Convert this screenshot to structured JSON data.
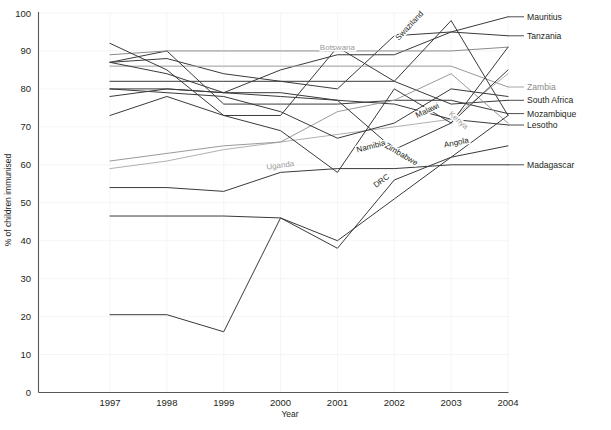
{
  "chart_data": {
    "type": "line",
    "title": "",
    "xlabel": "Year",
    "ylabel": "% of children immunised",
    "x": [
      1997,
      1998,
      1999,
      2000,
      2001,
      2002,
      2003,
      2004
    ],
    "xticklabels": [
      "1997",
      "1998",
      "1999",
      "2000",
      "2001",
      "2002",
      "2003",
      "2004"
    ],
    "yticks": [
      0,
      10,
      20,
      30,
      40,
      50,
      60,
      70,
      80,
      90,
      100
    ],
    "yticklabels": [
      "0",
      "10",
      "20",
      "30",
      "40",
      "50",
      "60",
      "70",
      "80",
      "90",
      "100"
    ],
    "ylim": [
      0,
      100
    ],
    "xlim": [
      1997,
      2004
    ],
    "grid": true,
    "legend": "inline-end-labels",
    "series": [
      {
        "name": "Mauritius",
        "color": "#3a3a3a",
        "label_side": "right",
        "label_y": 99,
        "values": [
          87,
          88,
          84,
          82,
          80,
          94,
          95,
          99
        ]
      },
      {
        "name": "Tanzania",
        "color": "#3a3a3a",
        "label_side": "right",
        "label_y": 94,
        "values": [
          78,
          80,
          79,
          85,
          89,
          89,
          95,
          94
        ]
      },
      {
        "name": "Zambia",
        "color": "#9a9a9a",
        "label_side": "right",
        "label_y": 80.5,
        "values": [
          86,
          86,
          86,
          86,
          86,
          86,
          86,
          80.5
        ]
      },
      {
        "name": "South Africa",
        "color": "#3a3a3a",
        "label_side": "right",
        "label_y": 77,
        "values": [
          82,
          82,
          82,
          82,
          82,
          82,
          76,
          77
        ]
      },
      {
        "name": "Mozambique",
        "color": "#3a3a3a",
        "label_side": "right",
        "label_y": 73.5,
        "values": [
          87,
          90,
          76,
          76,
          76,
          77,
          77,
          73.5
        ]
      },
      {
        "name": "Lesotho",
        "color": "#3a3a3a",
        "label_side": "right",
        "label_y": 70.5,
        "values": [
          80,
          80,
          79,
          78,
          77,
          76,
          72,
          70.5
        ]
      },
      {
        "name": "Madagascar",
        "color": "#3a3a3a",
        "label_side": "right",
        "label_y": 60,
        "values": [
          54,
          54,
          53,
          58,
          59,
          59,
          60,
          60
        ]
      },
      {
        "name": "Botswana",
        "color": "#8b8b8b",
        "label_side": "inline",
        "label_x": 2001,
        "label_y": 91,
        "values": [
          89,
          90,
          90,
          90,
          90,
          90,
          90,
          91
        ]
      },
      {
        "name": "Swaziland",
        "color": "#3a3a3a",
        "label_side": "inline",
        "label_x": 2002.3,
        "label_y": 97,
        "values": [
          92,
          85,
          73,
          73,
          91,
          82,
          98,
          73
        ]
      },
      {
        "name": "Uganda",
        "color": "#b0b0b0",
        "label_side": "inline",
        "label_x": 2000,
        "label_y": 60,
        "values": [
          59,
          61,
          64,
          66,
          68,
          70,
          72,
          84
        ]
      },
      {
        "name": "Kenya",
        "color": "#9a9a9a",
        "label_side": "inline",
        "label_x": 2003.1,
        "label_y": 72,
        "values": [
          61,
          63,
          65,
          66,
          74,
          77,
          84,
          71
        ]
      },
      {
        "name": "Malawi",
        "color": "#3a3a3a",
        "label_side": "inline",
        "label_x": 2002.6,
        "label_y": 74.5,
        "values": [
          87,
          84,
          79,
          79,
          77,
          64,
          71,
          85
        ]
      },
      {
        "name": "Namibia",
        "color": "#3a3a3a",
        "label_side": "inline",
        "label_x": 2001.6,
        "label_y": 65,
        "values": [
          80,
          79,
          78,
          74,
          67,
          71,
          80,
          78
        ]
      },
      {
        "name": "Zimbabwe",
        "color": "#3a3a3a",
        "label_side": "inline",
        "label_x": 2002.1,
        "label_y": 63,
        "values": [
          73,
          78,
          73,
          69,
          58,
          80,
          71,
          91
        ]
      },
      {
        "name": "Angola",
        "color": "#3a3a3a",
        "label_side": "inline",
        "label_x": 2003.1,
        "label_y": 66,
        "values": [
          46.5,
          46.5,
          46.5,
          46,
          38,
          56,
          62,
          65
        ]
      },
      {
        "name": "DRC",
        "color": "#3a3a3a",
        "label_side": "inline",
        "label_x": 2001.8,
        "label_y": 56,
        "values": [
          20.5,
          20.5,
          16,
          46,
          40,
          51,
          62,
          73
        ]
      }
    ]
  },
  "axes": {
    "y_title": "% of children immunised",
    "x_title": "Year"
  },
  "colors": {
    "axis": "#58585a",
    "grid": "#f2f2f2",
    "text": "#231f20",
    "light_series": "#9a9a9a",
    "dark_series": "#3a3a3a",
    "background": "#ffffff"
  }
}
